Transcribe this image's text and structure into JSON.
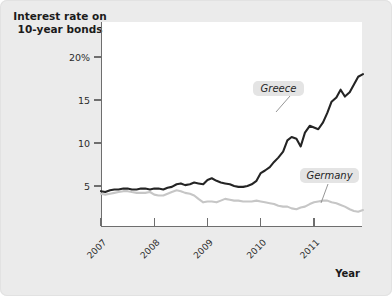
{
  "figure": {
    "background_color": "#ebebeb",
    "plot_background_color": "#ffffff"
  },
  "title": {
    "line1": "Interest rate on",
    "line2": "10-year bonds"
  },
  "axes": {
    "x_axis_name": "Year",
    "y_tick_labels": [
      "20%",
      "15",
      "10",
      "5"
    ],
    "x_tick_labels": [
      "2007",
      "2008",
      "2009",
      "2010",
      "2011"
    ]
  },
  "callouts": {
    "greece_label": "Greece",
    "germany_label": "Germany"
  },
  "chart_data": {
    "type": "line",
    "title": "Interest rate on 10-year bonds",
    "xlabel": "Year",
    "ylabel": "Interest rate on 10-year bonds",
    "yunit": "%",
    "ylim": [
      0,
      21
    ],
    "xlim": [
      2007.0,
      2011.95
    ],
    "yticks": [
      5,
      10,
      15,
      20
    ],
    "ytick_labels": [
      "5",
      "10",
      "15",
      "20%"
    ],
    "xticks": [
      2007,
      2008,
      2009,
      2010,
      2011
    ],
    "xtick_labels": [
      "2007",
      "2008",
      "2009",
      "2010",
      "2011"
    ],
    "grid": false,
    "legend": "inline-callouts",
    "colors": {
      "greece": "#242424",
      "germany": "#c6c6c6"
    },
    "series": [
      {
        "name": "Greece",
        "color": "#242424",
        "x": [
          2007.0,
          2007.08,
          2007.17,
          2007.25,
          2007.33,
          2007.42,
          2007.5,
          2007.58,
          2007.67,
          2007.75,
          2007.83,
          2007.92,
          2008.0,
          2008.08,
          2008.17,
          2008.25,
          2008.33,
          2008.42,
          2008.5,
          2008.58,
          2008.67,
          2008.75,
          2008.83,
          2008.92,
          2009.0,
          2009.08,
          2009.17,
          2009.25,
          2009.33,
          2009.42,
          2009.5,
          2009.58,
          2009.67,
          2009.75,
          2009.83,
          2009.92,
          2010.0,
          2010.08,
          2010.17,
          2010.25,
          2010.33,
          2010.42,
          2010.5,
          2010.58,
          2010.67,
          2010.75,
          2010.83,
          2010.92,
          2011.0,
          2011.08,
          2011.17,
          2011.25,
          2011.33,
          2011.42,
          2011.5,
          2011.58,
          2011.67,
          2011.75,
          2011.83,
          2011.92
        ],
        "y": [
          4.4,
          4.3,
          4.5,
          4.6,
          4.6,
          4.7,
          4.7,
          4.6,
          4.6,
          4.7,
          4.7,
          4.6,
          4.7,
          4.7,
          4.6,
          4.8,
          4.9,
          5.2,
          5.3,
          5.1,
          5.2,
          5.4,
          5.3,
          5.2,
          5.7,
          5.9,
          5.6,
          5.4,
          5.3,
          5.2,
          5.0,
          4.9,
          4.9,
          5.0,
          5.2,
          5.6,
          6.5,
          6.8,
          7.2,
          7.8,
          8.3,
          9.0,
          10.3,
          10.7,
          10.5,
          9.6,
          11.2,
          12.0,
          11.8,
          11.6,
          12.4,
          13.5,
          14.8,
          15.3,
          16.2,
          15.4,
          15.9,
          16.8,
          17.7,
          18.0
        ]
      },
      {
        "name": "Germany",
        "color": "#c6c6c6",
        "x": [
          2007.0,
          2007.08,
          2007.17,
          2007.25,
          2007.33,
          2007.42,
          2007.5,
          2007.58,
          2007.67,
          2007.75,
          2007.83,
          2007.92,
          2008.0,
          2008.08,
          2008.17,
          2008.25,
          2008.33,
          2008.42,
          2008.5,
          2008.58,
          2008.67,
          2008.75,
          2008.83,
          2008.92,
          2009.0,
          2009.08,
          2009.17,
          2009.25,
          2009.33,
          2009.42,
          2009.5,
          2009.58,
          2009.67,
          2009.75,
          2009.83,
          2009.92,
          2010.0,
          2010.08,
          2010.17,
          2010.25,
          2010.33,
          2010.42,
          2010.5,
          2010.58,
          2010.67,
          2010.75,
          2010.83,
          2010.92,
          2011.0,
          2011.08,
          2011.17,
          2011.25,
          2011.33,
          2011.42,
          2011.5,
          2011.58,
          2011.67,
          2011.75,
          2011.83,
          2011.92
        ],
        "y": [
          4.1,
          4.0,
          4.1,
          4.2,
          4.3,
          4.4,
          4.4,
          4.3,
          4.2,
          4.2,
          4.2,
          4.3,
          4.0,
          3.9,
          3.9,
          4.1,
          4.3,
          4.5,
          4.4,
          4.2,
          4.1,
          3.9,
          3.5,
          3.1,
          3.2,
          3.2,
          3.1,
          3.3,
          3.5,
          3.4,
          3.3,
          3.3,
          3.2,
          3.2,
          3.2,
          3.3,
          3.2,
          3.1,
          3.0,
          2.9,
          2.7,
          2.6,
          2.6,
          2.4,
          2.3,
          2.5,
          2.6,
          2.9,
          3.1,
          3.2,
          3.3,
          3.3,
          3.1,
          3.0,
          2.8,
          2.6,
          2.3,
          2.1,
          2.0,
          2.2
        ]
      }
    ]
  }
}
